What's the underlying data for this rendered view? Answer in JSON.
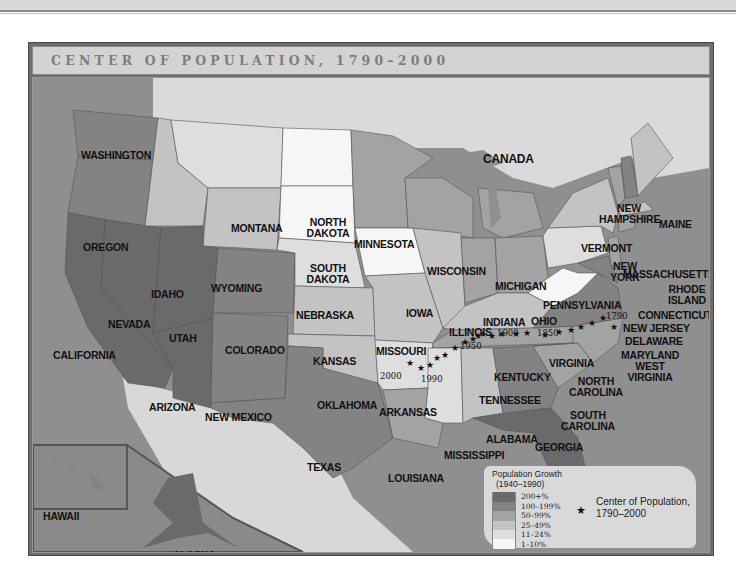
{
  "page": {
    "title": "CENTER OF POPULATION, 1790–2000"
  },
  "colors": {
    "ocean": "#8f8f8f",
    "foreign_land": "#dadada",
    "frame": "#6e6e6e",
    "tier_200_plus": "#6a6a6a",
    "tier_100_199": "#838383",
    "tier_50_99": "#a3a3a3",
    "tier_25_49": "#c3c3c3",
    "tier_11_24": "#dedede",
    "tier_1_10": "#f6f6f6"
  },
  "map": {
    "country_label": "CANADA",
    "states": [
      {
        "name": "WASHINGTON",
        "tier": "100-199%"
      },
      {
        "name": "OREGON",
        "tier": "100-199%"
      },
      {
        "name": "CALIFORNIA",
        "tier": "200+%"
      },
      {
        "name": "NEVADA",
        "tier": "200+%"
      },
      {
        "name": "IDAHO",
        "tier": "25-49%"
      },
      {
        "name": "MONTANA",
        "tier": "11-24%"
      },
      {
        "name": "WYOMING",
        "tier": "25-49%"
      },
      {
        "name": "UTAH",
        "tier": "200+%"
      },
      {
        "name": "COLORADO",
        "tier": "100-199%"
      },
      {
        "name": "ARIZONA",
        "tier": "200+%"
      },
      {
        "name": "NEW MEXICO",
        "tier": "100-199%"
      },
      {
        "name": "NORTH DAKOTA",
        "tier": "1-10%"
      },
      {
        "name": "SOUTH DAKOTA",
        "tier": "1-10%"
      },
      {
        "name": "NEBRASKA",
        "tier": "11-24%"
      },
      {
        "name": "KANSAS",
        "tier": "25-49%"
      },
      {
        "name": "OKLAHOMA",
        "tier": "25-49%"
      },
      {
        "name": "TEXAS",
        "tier": "100-199%"
      },
      {
        "name": "MINNESOTA",
        "tier": "50-99%"
      },
      {
        "name": "IOWA",
        "tier": "1-10%"
      },
      {
        "name": "MISSOURI",
        "tier": "25-49%"
      },
      {
        "name": "ARKANSAS",
        "tier": "11-24%"
      },
      {
        "name": "LOUISIANA",
        "tier": "50-99%"
      },
      {
        "name": "WISCONSIN",
        "tier": "50-99%"
      },
      {
        "name": "ILLINOIS",
        "tier": "25-49%"
      },
      {
        "name": "MICHIGAN",
        "tier": "50-99%"
      },
      {
        "name": "INDIANA",
        "tier": "50-99%"
      },
      {
        "name": "OHIO",
        "tier": "50-99%"
      },
      {
        "name": "KENTUCKY",
        "tier": "25-49%"
      },
      {
        "name": "TENNESSEE",
        "tier": "50-99%"
      },
      {
        "name": "MISSISSIPPI",
        "tier": "11-24%"
      },
      {
        "name": "ALABAMA",
        "tier": "25-49%"
      },
      {
        "name": "GEORGIA",
        "tier": "100-199%"
      },
      {
        "name": "FLORIDA",
        "tier": "200+%"
      },
      {
        "name": "SOUTH CAROLINA",
        "tier": "50-99%"
      },
      {
        "name": "NORTH CAROLINA",
        "tier": "50-99%"
      },
      {
        "name": "VIRGINIA",
        "tier": "100-199%"
      },
      {
        "name": "WEST VIRGINIA",
        "tier": "1-10%"
      },
      {
        "name": "PENNSYLVANIA",
        "tier": "11-24%"
      },
      {
        "name": "NEW YORK",
        "tier": "25-49%"
      },
      {
        "name": "VERMONT",
        "tier": "50-99%"
      },
      {
        "name": "NEW HAMPSHIRE",
        "tier": "100-199%"
      },
      {
        "name": "MAINE",
        "tier": "25-49%"
      },
      {
        "name": "MASSACHUSETTS",
        "tier": "25-49%"
      },
      {
        "name": "RHODE ISLAND",
        "tier": "25-49%"
      },
      {
        "name": "CONNECTICUT",
        "tier": "50-99%"
      },
      {
        "name": "NEW JERSEY",
        "tier": "50-99%"
      },
      {
        "name": "DELAWARE",
        "tier": "100-199%"
      },
      {
        "name": "MARYLAND",
        "tier": "100-199%"
      },
      {
        "name": "HAWAII",
        "tier": "100-199%"
      },
      {
        "name": "ALASKA",
        "tier": "200+%"
      }
    ],
    "year_labels": [
      "1790",
      "1850",
      "1900",
      "1950",
      "1990",
      "2000"
    ]
  },
  "legend": {
    "title_line1": "Population Growth",
    "title_line2": "(1940–1990)",
    "items": [
      {
        "label": "200+%"
      },
      {
        "label": "100–199%"
      },
      {
        "label": "50–99%"
      },
      {
        "label": "25–49%"
      },
      {
        "label": "11–24%"
      },
      {
        "label": "1–10%"
      }
    ],
    "center_line1": "Center of Population,",
    "center_line2": "1790–2000"
  }
}
